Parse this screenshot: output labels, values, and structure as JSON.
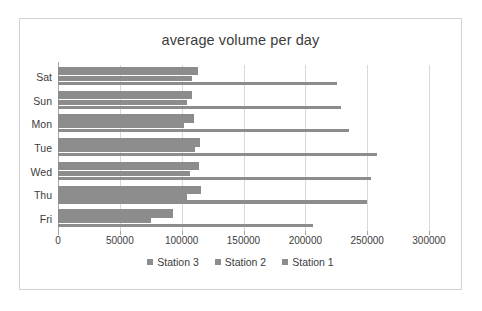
{
  "chart_data": {
    "type": "bar",
    "orientation": "horizontal",
    "title": "average volume per day",
    "xlabel": "",
    "ylabel": "",
    "xlim": [
      0,
      300000
    ],
    "xticks": [
      0,
      50000,
      100000,
      150000,
      200000,
      250000,
      300000
    ],
    "xtick_labels": [
      "0",
      "50000",
      "100000",
      "150000",
      "200000",
      "250000",
      "300000"
    ],
    "categories": [
      "Sat",
      "Sun",
      "Mon",
      "Tue",
      "Wed",
      "Thu",
      "Fri"
    ],
    "grid": true,
    "grid_axis": "x",
    "legend_position": "bottom",
    "bar_color": "#8c8c8c",
    "series": [
      {
        "name": "Station 3",
        "values": [
          113000,
          108000,
          110000,
          115000,
          114000,
          116000,
          93000
        ]
      },
      {
        "name": "Station 2",
        "values": [
          108000,
          104000,
          102000,
          111000,
          107000,
          104000,
          75000
        ]
      },
      {
        "name": "Station 1",
        "values": [
          226000,
          229000,
          235000,
          258000,
          253000,
          250000,
          206000
        ]
      }
    ]
  },
  "legend": {
    "entries": [
      {
        "label": "Station 3"
      },
      {
        "label": "Station 2"
      },
      {
        "label": "Station 1"
      }
    ]
  }
}
